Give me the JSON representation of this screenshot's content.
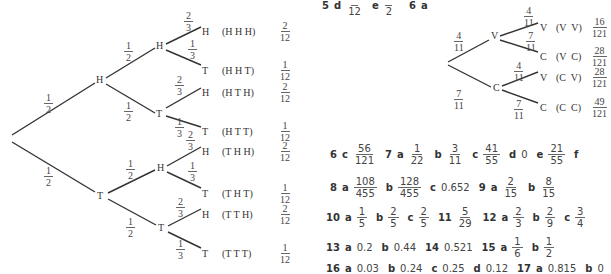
{
  "left_tree": {
    "root_branches": [
      {
        "prob": "1/2",
        "node": "H"
      },
      {
        "prob": "1/2",
        "node": "T"
      }
    ],
    "level2": [
      {
        "parent": "H",
        "prob": "1/2",
        "node": "H"
      },
      {
        "parent": "H",
        "prob": "1/2",
        "node": "T"
      },
      {
        "parent": "T",
        "prob": "1/2",
        "node": "H"
      },
      {
        "parent": "T",
        "prob": "1/2",
        "node": "T"
      }
    ],
    "leaves": [
      {
        "prob": "2/3",
        "node": "H",
        "outcome": "(H H H)",
        "result_n": "2",
        "result_d": "12"
      },
      {
        "prob": "1/3",
        "node": "T",
        "outcome": "(H H T)",
        "result_n": "1",
        "result_d": "12"
      },
      {
        "prob": "2/3",
        "node": "H",
        "outcome": "(H T H)",
        "result_n": "2",
        "result_d": "12"
      },
      {
        "prob": "1/3",
        "node": "T",
        "outcome": "(H T T)",
        "result_n": "1",
        "result_d": "12"
      },
      {
        "prob": "2/3",
        "node": "H",
        "outcome": "(T H H)",
        "result_n": "2",
        "result_d": "12"
      },
      {
        "prob": "1/3",
        "node": "T",
        "outcome": "(T H T)",
        "result_n": "1",
        "result_d": "12"
      },
      {
        "prob": "2/3",
        "node": "H",
        "outcome": "(T T H)",
        "result_n": "2",
        "result_d": "12"
      },
      {
        "prob": "1/3",
        "node": "T",
        "outcome": "(T T T)",
        "result_n": "1",
        "result_d": "12"
      }
    ]
  },
  "right_tree": {
    "branches": [
      {
        "prob_n": "4",
        "prob_d": "11",
        "node": "V"
      },
      {
        "prob_n": "7",
        "prob_d": "11",
        "node": "C"
      }
    ],
    "leaves": [
      {
        "prob_n": "4",
        "prob_d": "11",
        "node": "V",
        "outcome": "(V  V)",
        "result_n": "16",
        "result_d": "121"
      },
      {
        "prob_n": "7",
        "prob_d": "11",
        "node": "C",
        "outcome": "(V  C)",
        "result_n": "28",
        "result_d": "121"
      },
      {
        "prob_n": "4",
        "prob_d": "11",
        "node": "V",
        "outcome": "(C  V)",
        "result_n": "28",
        "result_d": "121"
      },
      {
        "prob_n": "7",
        "prob_d": "11",
        "node": "C",
        "outcome": "(C  C)",
        "result_n": "49",
        "result_d": "121"
      }
    ]
  },
  "answers": {
    "row0": {
      "q5": "5",
      "d": "d",
      "d_den": "12",
      "e": "e",
      "e_den": "2",
      "q6": "6",
      "a": "a"
    },
    "row1": {
      "q6": "6",
      "c": "c",
      "c_n": "56",
      "c_d": "121",
      "q7": "7",
      "a": "a",
      "a_n": "1",
      "a_d": "22",
      "b": "b",
      "b_n": "3",
      "b_d": "11",
      "c2": "c",
      "c2_n": "41",
      "c2_d": "55",
      "d": "d",
      "d_v": "0",
      "e": "e",
      "e_n": "21",
      "e_d": "55",
      "f": "f"
    },
    "row2": {
      "q8": "8",
      "a": "a",
      "a_n": "108",
      "a_d": "455",
      "b": "b",
      "b_n": "128",
      "b_d": "455",
      "c": "c",
      "c_v": "0.652",
      "q9": "9",
      "a9": "a",
      "a9_n": "2",
      "a9_d": "15",
      "b9": "b",
      "b9_n": "8",
      "b9_d": "15"
    },
    "row3": {
      "q10": "10",
      "a": "a",
      "a_n": "1",
      "a_d": "5",
      "b": "b",
      "b_n": "2",
      "b_d": "5",
      "c": "c",
      "c_n": "2",
      "c_d": "5",
      "q11": "11",
      "q11_n": "5",
      "q11_d": "29",
      "q12": "12",
      "a12": "a",
      "a12_n": "2",
      "a12_d": "3",
      "b12": "b",
      "b12_n": "2",
      "b12_d": "9",
      "c12": "c",
      "c12_n": "3",
      "c12_d": "4"
    },
    "row4": {
      "q13": "13",
      "a": "a",
      "a_v": "0.2",
      "b": "b",
      "b_v": "0.44",
      "q14": "14",
      "q14_v": "0.521",
      "q15": "15",
      "a15": "a",
      "a15_n": "1",
      "a15_d": "6",
      "b15": "b",
      "b15_n": "1",
      "b15_d": "2"
    },
    "row5_partial": {
      "q16": "16",
      "a": "a",
      "a_v": "0.03",
      "b": "b",
      "b_v": "0.24",
      "c": "c",
      "c_v": "0.25",
      "d": "d",
      "d_v": "0.12",
      "q17": "17",
      "a17": "a",
      "a17_v": "0.815",
      "b17": "b",
      "b17_v": "0"
    }
  }
}
